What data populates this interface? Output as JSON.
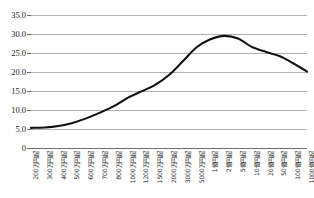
{
  "chart_data": {
    "type": "line",
    "title": "",
    "subtitle": "",
    "xlabel": "",
    "ylabel": "",
    "grid": true,
    "legend": false,
    "ylim": [
      0,
      35
    ],
    "ytick_labels": [
      "35.0",
      "30.0",
      "25.0",
      "20.0",
      "15.0",
      "10.0",
      "5.0",
      "0"
    ],
    "ytick_values": [
      35.0,
      30.0,
      25.0,
      20.0,
      15.0,
      10.0,
      5.0,
      0
    ],
    "categories": [
      "200万円超",
      "300万円超",
      "400万円超",
      "500万円超",
      "600万円超",
      "700万円超",
      "800万円超",
      "1000万円超",
      "1200万円超",
      "1500万円超",
      "2000万円超",
      "3000万円超",
      "5000万円超",
      "1億円超",
      "2億円超",
      "5億円超",
      "10億円超",
      "20億円超",
      "50億円超",
      "100億円超",
      "1000億円超"
    ],
    "series": [
      {
        "name": "負担率",
        "color": "#111111",
        "values": [
          5.3,
          5.4,
          5.8,
          6.6,
          7.8,
          9.3,
          11.0,
          13.2,
          14.9,
          16.6,
          19.2,
          22.8,
          26.5,
          28.6,
          29.5,
          28.8,
          26.6,
          25.3,
          24.2,
          22.3,
          20.1
        ]
      }
    ]
  },
  "axes": {
    "y_axis_name": "y-axis",
    "x_axis_name": "x-axis"
  }
}
